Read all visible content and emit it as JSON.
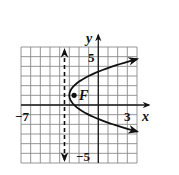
{
  "chart_data": {
    "type": "line",
    "title": "",
    "equation": "(y-1)^2 = 2(x+3)",
    "xlabel": "x",
    "ylabel": "y",
    "xlim": [
      -8,
      4
    ],
    "ylim": [
      -6,
      6
    ],
    "grid": true,
    "tick_labels": {
      "x": [
        {
          "value": -7,
          "label": "−7"
        },
        {
          "value": 3,
          "label": "3"
        }
      ],
      "y": [
        {
          "value": 5,
          "label": "5"
        },
        {
          "value": -5,
          "label": "−5"
        }
      ]
    },
    "series": [
      {
        "name": "parabola",
        "style": "solid, arrows at both ends",
        "points": [
          {
            "x": 4,
            "y": 4.74
          },
          {
            "x": 2,
            "y": 4.16
          },
          {
            "x": 0,
            "y": 3.45
          },
          {
            "x": -1,
            "y": 3.0
          },
          {
            "x": -2,
            "y": 2.41
          },
          {
            "x": -2.5,
            "y": 2.0
          },
          {
            "x": -3,
            "y": 1
          },
          {
            "x": -2.5,
            "y": 0.0
          },
          {
            "x": -2,
            "y": -0.41
          },
          {
            "x": -1,
            "y": -1.0
          },
          {
            "x": 0,
            "y": -1.45
          },
          {
            "x": 2,
            "y": -2.16
          },
          {
            "x": 4,
            "y": -2.74
          }
        ]
      },
      {
        "name": "directrix",
        "style": "dashed vertical line, arrows at both ends",
        "x": -3.5
      }
    ],
    "annotations": [
      {
        "label": "F",
        "x": -2.5,
        "y": 1,
        "marker": "filled-dot"
      }
    ]
  },
  "labels": {
    "x_axis": "x",
    "y_axis": "y",
    "x_min_tick": "−7",
    "x_max_tick": "3",
    "y_max_tick": "5",
    "y_min_tick": "−5",
    "focus": "F"
  }
}
